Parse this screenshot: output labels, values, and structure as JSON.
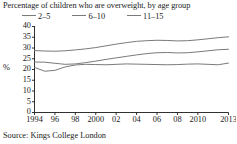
{
  "title": "Percentage of children who are overweight, by age group",
  "source": "Source: Kings College London",
  "ylabel": "%",
  "legend": [
    {
      "label": "2–5"
    },
    {
      "label": "6–10"
    },
    {
      "label": "11–15"
    }
  ],
  "colors": {
    "line": "#7a7a7a",
    "axis": "#1a1a1a",
    "text": "#1a1a1a",
    "background": "#ffffff"
  },
  "chart_data": {
    "type": "line",
    "title": "Percentage of children who are overweight, by age group",
    "xlabel": "",
    "ylabel": "%",
    "ylim": [
      0,
      40
    ],
    "xlim": [
      1994,
      2013
    ],
    "ytick_values": [
      0,
      5,
      10,
      15,
      20,
      25,
      30,
      35,
      40
    ],
    "ytick_labels": [
      "0",
      "5",
      "10",
      "15",
      "20",
      "25",
      "30",
      "35",
      "40"
    ],
    "xtick_values": [
      1994,
      1996,
      1998,
      2000,
      2002,
      2004,
      2006,
      2008,
      2010,
      2013
    ],
    "xtick_labels": [
      "1994",
      "96",
      "98",
      "2000",
      "02",
      "04",
      "06",
      "08",
      "2010",
      "2013"
    ],
    "grid": false,
    "legend_position": "top",
    "x": [
      1994,
      1995,
      1996,
      1997,
      1998,
      1999,
      2000,
      2001,
      2002,
      2003,
      2004,
      2005,
      2006,
      2007,
      2008,
      2009,
      2010,
      2011,
      2012,
      2013
    ],
    "series": [
      {
        "name": "11–15",
        "values": [
          28.8,
          28.6,
          28.5,
          28.7,
          29.1,
          29.6,
          30.2,
          31.0,
          31.8,
          32.5,
          33.1,
          33.4,
          33.6,
          33.5,
          33.3,
          33.4,
          33.8,
          34.3,
          34.8,
          35.2
        ]
      },
      {
        "name": "6–10",
        "values": [
          23.5,
          23.4,
          22.9,
          22.4,
          22.6,
          23.2,
          23.9,
          24.7,
          25.4,
          26.1,
          26.8,
          27.4,
          27.8,
          27.9,
          27.7,
          27.8,
          28.2,
          28.7,
          29.2,
          29.4
        ]
      },
      {
        "name": "2–5",
        "values": [
          21.0,
          19.2,
          19.6,
          21.2,
          22.1,
          22.4,
          22.3,
          22.2,
          22.4,
          22.6,
          22.5,
          22.4,
          22.3,
          22.2,
          22.3,
          22.5,
          22.6,
          22.4,
          22.2,
          23.0
        ]
      }
    ]
  }
}
